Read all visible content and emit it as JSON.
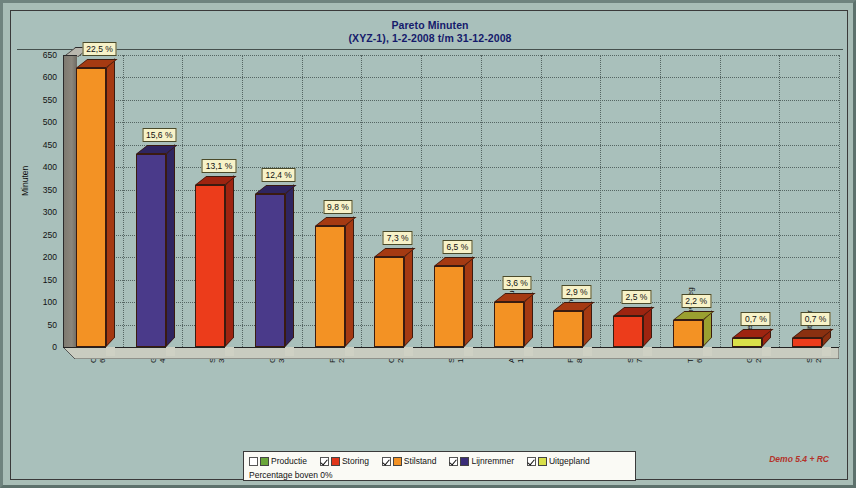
{
  "window": {
    "background_color": "#a8bdb6"
  },
  "chart_panel": {
    "background_color": "#a9c0bb",
    "border_color": "#3a3a3a"
  },
  "title": {
    "line1": "Pareto Minuten",
    "line2": "(XYZ-1), 1-2-2008 t/m 31-12-2008",
    "color": "#151a6b"
  },
  "axes": {
    "ylabel": "Minuten",
    "yticks": [
      0,
      50,
      100,
      150,
      200,
      250,
      300,
      350,
      400,
      450,
      500,
      550,
      600,
      650
    ],
    "ymin": 0,
    "ymax": 650,
    "grid": true
  },
  "legend": {
    "position": "bottom",
    "items": [
      {
        "label": "Productie",
        "color": "#6aa63a",
        "checked": false
      },
      {
        "label": "Storing",
        "color": "#e0361a",
        "checked": true
      },
      {
        "label": "Stilstand",
        "color": "#f39224",
        "checked": true
      },
      {
        "label": "Lijnremmer",
        "color": "#3a2d78",
        "checked": true
      },
      {
        "label": "Uitgepland",
        "color": "#d9e04a",
        "checked": true
      }
    ],
    "note": "Percentage boven 0%"
  },
  "footer": {
    "demo_tag": "Demo 5.4 + RC",
    "demo_tag_color": "#b4322a"
  },
  "chart_data": {
    "type": "bar",
    "title": "Pareto Minuten",
    "subtitle": "(XYZ-1), 1-2-2008 t/m 31-12-2008",
    "xlabel": "",
    "ylabel": "Minuten",
    "ylim": [
      0,
      650
    ],
    "yticks": [
      0,
      50,
      100,
      150,
      200,
      250,
      300,
      350,
      400,
      450,
      500,
      550,
      600,
      650
    ],
    "grid": true,
    "legend_position": "bottom",
    "categories": [
      "Ombouwen",
      "Geen aanvoer",
      "Storing Vuller",
      "Geen afvoer",
      "Pauze",
      "Opstarten",
      "Schoonmaken",
      "Autonoom onderhoud",
      "Preventief onderhoud",
      "Storing Invoer",
      "Training/Werkoverleg",
      "Geen orders",
      "Storing Uitvoer"
    ],
    "values": [
      620,
      430,
      360,
      340,
      270,
      200,
      180,
      100,
      80,
      70,
      60,
      20,
      20
    ],
    "percent_labels": [
      "22,5 %",
      "15,6 %",
      "13,1 %",
      "12,4 %",
      "9,8 %",
      "7,3 %",
      "6,5 %",
      "3,6 %",
      "2,9 %",
      "2,5 %",
      "2,2 %",
      "0,7 %",
      "0,7 %"
    ],
    "minute_labels": [
      "620 min",
      "430 min",
      "360 min",
      "340 min",
      "270 min",
      "200 min",
      "180 min",
      "100 min",
      "80 min",
      "70 min",
      "60 min",
      "20 min",
      "20 min"
    ],
    "bar_categories": [
      "Stilstand",
      "Lijnremmer",
      "Storing",
      "Lijnremmer",
      "Stilstand",
      "Stilstand",
      "Stilstand",
      "Stilstand",
      "Stilstand",
      "Storing",
      "Stilstand",
      "Uitgepland",
      "Storing"
    ],
    "bar_colors": [
      "#f39224",
      "#4a3a8a",
      "#ec3c1b",
      "#4a3a8a",
      "#f39224",
      "#f39224",
      "#f39224",
      "#f39224",
      "#f39224",
      "#ec3c1b",
      "#f39224",
      "#d9e04a",
      "#ec3c1b"
    ],
    "bar_dark_colors": [
      "#a53a12",
      "#2f2560",
      "#9e2410",
      "#2f2560",
      "#a53a12",
      "#a53a12",
      "#a53a12",
      "#a53a12",
      "#a53a12",
      "#9e2410",
      "#9aa030",
      "#9e2410"
    ]
  }
}
